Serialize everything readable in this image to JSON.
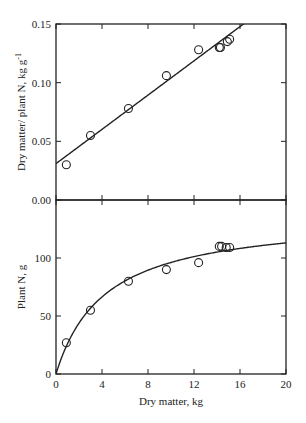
{
  "figure": {
    "xlabel": "Dry matter, kg",
    "top_ylabel": "Dry matter/ plant N, kg g",
    "top_ylabel_sup": "-1",
    "bottom_ylabel": "Plant N, g",
    "colors": {
      "ink": "#222222",
      "background": "#ffffff"
    }
  },
  "chart_data": [
    {
      "type": "scatter",
      "title": "",
      "xlabel": "",
      "ylabel": "Dry matter/ plant N, kg g-1",
      "xlim": [
        0,
        20
      ],
      "ylim": [
        0,
        0.15
      ],
      "x_ticks": [
        0,
        4,
        8,
        12,
        16,
        20
      ],
      "y_ticks": [
        0.0,
        0.05,
        0.1,
        0.15
      ],
      "y_tick_labels": [
        "0.00",
        "0.05",
        "0.10",
        "0.15"
      ],
      "grid": false,
      "series": [
        {
          "name": "observed",
          "marker": "open-circle",
          "x": [
            0.9,
            3.0,
            6.3,
            9.6,
            12.4,
            14.2,
            14.3,
            14.9,
            15.1
          ],
          "y": [
            0.03,
            0.055,
            0.078,
            0.106,
            0.128,
            0.13,
            0.13,
            0.135,
            0.137
          ]
        },
        {
          "name": "linear fit",
          "line": "solid",
          "intercept": 0.031,
          "slope": 0.0073
        }
      ]
    },
    {
      "type": "scatter",
      "title": "",
      "xlabel": "Dry matter, kg",
      "ylabel": "Plant N, g",
      "xlim": [
        0,
        20
      ],
      "ylim": [
        0,
        150
      ],
      "x_ticks": [
        0,
        4,
        8,
        12,
        16,
        20
      ],
      "x_tick_labels": [
        "0",
        "4",
        "8",
        "12",
        "16",
        "20"
      ],
      "y_ticks": [
        0,
        50,
        100
      ],
      "y_tick_labels": [
        "0",
        "50",
        "100"
      ],
      "grid": false,
      "series": [
        {
          "name": "observed",
          "marker": "open-circle",
          "x": [
            0.9,
            3.0,
            6.3,
            9.6,
            12.4,
            14.2,
            14.4,
            14.8,
            15.1
          ],
          "y": [
            27,
            55,
            80,
            90,
            96,
            110,
            110,
            109,
            109
          ]
        },
        {
          "name": "hyperbolic fit",
          "line": "solid",
          "equation": "N = DM / (0.031 + 0.0073 * DM)"
        }
      ]
    }
  ]
}
